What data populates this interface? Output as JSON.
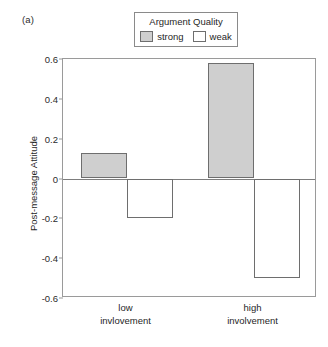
{
  "panel": {
    "label": "(a)"
  },
  "legend": {
    "title": "Argument Quality",
    "entries": [
      {
        "label": "strong",
        "color": "#cfcfcf"
      },
      {
        "label": "weak",
        "color": "#ffffff"
      }
    ]
  },
  "axes": {
    "ylabel": "Post-message Attitude",
    "yticks": [
      "0.6",
      "0.4",
      "0.2",
      "0",
      "-0.2",
      "-0.4",
      "-0.6"
    ],
    "xlabels": [
      {
        "line1": "low",
        "line2": "invlovement"
      },
      {
        "line1": "high",
        "line2": "involvement"
      }
    ]
  },
  "chart_data": {
    "type": "bar",
    "title": "",
    "xlabel": "",
    "ylabel": "Post-message Attitude",
    "categories": [
      "low invlovement",
      "high involvement"
    ],
    "series": [
      {
        "name": "strong",
        "color": "#cfcfcf",
        "values": [
          0.13,
          0.58
        ]
      },
      {
        "name": "weak",
        "color": "#ffffff",
        "values": [
          -0.2,
          -0.5
        ]
      }
    ],
    "ylim": [
      -0.6,
      0.6
    ],
    "yticks": [
      0.6,
      0.4,
      0.2,
      0,
      -0.2,
      -0.4,
      -0.6
    ],
    "grid": false,
    "legend_position": "top-center",
    "legend_title": "Argument Quality",
    "annotations": [
      "(a)"
    ]
  }
}
